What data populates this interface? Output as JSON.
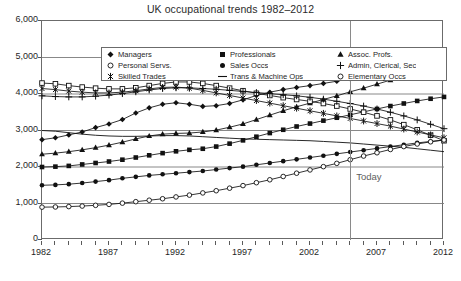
{
  "chart_data": {
    "type": "line",
    "title": "UK occupational trends 1982–2012",
    "xlabel": "",
    "ylabel": "",
    "xlim": [
      1982,
      2012
    ],
    "ylim": [
      0,
      6000
    ],
    "yticks": [
      "0",
      "1,000",
      "2,000",
      "3,000",
      "4,000",
      "5,000",
      "6,000"
    ],
    "ytick_values": [
      0,
      1000,
      2000,
      3000,
      4000,
      5000,
      6000
    ],
    "xticks": [
      "1982",
      "1987",
      "1992",
      "1997",
      "2002",
      "2007",
      "2012"
    ],
    "xtick_values": [
      1982,
      1987,
      1992,
      1997,
      2002,
      2007,
      2012
    ],
    "x_minor_tick_step": 1,
    "grid": "horizontal",
    "legend_position": "top-inside",
    "annotations": [
      {
        "label": "Today",
        "x": 2005,
        "type": "vertical-line"
      }
    ],
    "x": [
      1982,
      1983,
      1984,
      1985,
      1986,
      1987,
      1988,
      1989,
      1990,
      1991,
      1992,
      1993,
      1994,
      1995,
      1996,
      1997,
      1998,
      1999,
      2000,
      2001,
      2002,
      2003,
      2004,
      2005,
      2006,
      2007,
      2008,
      2009,
      2010,
      2011,
      2012
    ],
    "series": [
      {
        "name": "Managers",
        "marker": "filled-diamond",
        "values": [
          2750,
          2800,
          2880,
          2960,
          3080,
          3180,
          3300,
          3480,
          3620,
          3720,
          3760,
          3720,
          3660,
          3680,
          3740,
          3840,
          3960,
          4050,
          4120,
          4180,
          4230,
          4290,
          4350,
          4420,
          4480,
          4560,
          4620,
          4700,
          4760,
          4830,
          4900
        ]
      },
      {
        "name": "Professionals",
        "marker": "filled-square",
        "values": [
          2000,
          2010,
          2030,
          2070,
          2110,
          2150,
          2200,
          2260,
          2320,
          2380,
          2430,
          2470,
          2500,
          2560,
          2640,
          2730,
          2830,
          2930,
          3020,
          3110,
          3190,
          3270,
          3350,
          3430,
          3510,
          3590,
          3670,
          3740,
          3810,
          3870,
          3920
        ]
      },
      {
        "name": "Assoc. Profs.",
        "marker": "filled-triangle",
        "values": [
          2350,
          2380,
          2420,
          2470,
          2530,
          2600,
          2680,
          2770,
          2850,
          2900,
          2920,
          2930,
          2960,
          3010,
          3090,
          3180,
          3300,
          3420,
          3540,
          3650,
          3750,
          3850,
          3950,
          4060,
          4160,
          4270,
          4380,
          4480,
          4580,
          4680,
          4790
        ]
      },
      {
        "name": "Personal Servs.",
        "marker": "open-square",
        "values": [
          4300,
          4280,
          4230,
          4190,
          4160,
          4140,
          4140,
          4170,
          4230,
          4290,
          4330,
          4330,
          4290,
          4230,
          4160,
          4090,
          4020,
          3960,
          3900,
          3850,
          3800,
          3740,
          3670,
          3590,
          3500,
          3400,
          3290,
          3160,
          3020,
          2870,
          2720
        ]
      },
      {
        "name": "Sales Occs",
        "marker": "filled-circle",
        "values": [
          1500,
          1510,
          1530,
          1560,
          1600,
          1640,
          1690,
          1730,
          1770,
          1800,
          1830,
          1860,
          1890,
          1930,
          1970,
          2010,
          2060,
          2110,
          2160,
          2210,
          2260,
          2310,
          2360,
          2410,
          2460,
          2510,
          2560,
          2610,
          2660,
          2700,
          2740
        ]
      },
      {
        "name": "Admin, Clerical, Sec",
        "marker": "plus-star",
        "values": [
          3950,
          3930,
          3920,
          3920,
          3940,
          3970,
          4010,
          4060,
          4110,
          4150,
          4170,
          4170,
          4150,
          4130,
          4100,
          4070,
          4040,
          4010,
          3980,
          3950,
          3910,
          3860,
          3800,
          3740,
          3670,
          3590,
          3500,
          3400,
          3290,
          3170,
          3050
        ]
      },
      {
        "name": "Skilled Trades",
        "marker": "asterisk",
        "values": [
          4150,
          4120,
          4080,
          4050,
          4030,
          4030,
          4050,
          4090,
          4140,
          4180,
          4190,
          4160,
          4100,
          4030,
          3960,
          3890,
          3820,
          3750,
          3680,
          3610,
          3540,
          3470,
          3400,
          3330,
          3260,
          3190,
          3120,
          3040,
          2960,
          2880,
          2800
        ]
      },
      {
        "name": "Trans & Machine Ops",
        "marker": "line",
        "values": [
          3000,
          2980,
          2940,
          2900,
          2870,
          2850,
          2840,
          2840,
          2850,
          2860,
          2860,
          2850,
          2830,
          2810,
          2790,
          2770,
          2760,
          2750,
          2740,
          2730,
          2720,
          2700,
          2680,
          2660,
          2630,
          2600,
          2570,
          2540,
          2500,
          2460,
          2420
        ]
      },
      {
        "name": "Elementary Occs",
        "marker": "open-circle",
        "values": [
          900,
          905,
          915,
          930,
          950,
          975,
          1010,
          1050,
          1090,
          1130,
          1180,
          1230,
          1290,
          1350,
          1420,
          1490,
          1570,
          1650,
          1740,
          1830,
          1920,
          2010,
          2100,
          2200,
          2300,
          2390,
          2480,
          2560,
          2630,
          2690,
          2740
        ]
      }
    ]
  },
  "legend": {
    "entries": [
      {
        "label": "Managers",
        "marker": "filled-diamond"
      },
      {
        "label": "Professionals",
        "marker": "filled-square"
      },
      {
        "label": "Assoc. Profs.",
        "marker": "filled-triangle"
      },
      {
        "label": "Personal Servs.",
        "marker": "open-circle"
      },
      {
        "label": "Sales Occs",
        "marker": "filled-circle"
      },
      {
        "label": "Admin, Clerical, Sec",
        "marker": "plus-star"
      },
      {
        "label": "Skilled Trades",
        "marker": "asterisk"
      },
      {
        "label": "Trans & Machine Ops",
        "marker": "line"
      },
      {
        "label": "Elementary Occs",
        "marker": "open-circle"
      }
    ]
  },
  "caption": {
    "text": ""
  },
  "colors": {
    "series": "#111111",
    "frame": "#6b6b6b",
    "grid": "#7a7a7a",
    "today_line": "#8a8a8a",
    "today_text": "#5e5e5e",
    "background": "#ffffff"
  }
}
